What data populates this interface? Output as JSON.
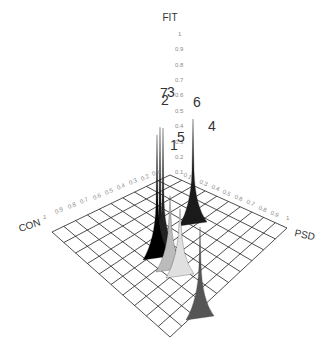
{
  "chart_data": {
    "type": "3d-surface",
    "title": "",
    "axes": {
      "z": {
        "label": "FIT",
        "ticks": [
          "0.1",
          "0.2",
          "0.3",
          "0.4",
          "0.5",
          "0.6",
          "0.7",
          "0.8",
          "0.9",
          "1"
        ],
        "range": [
          0,
          1
        ]
      },
      "x": {
        "label": "CON",
        "ticks": [
          "0.1",
          "0.2",
          "0.3",
          "0.4",
          "0.5",
          "0.6",
          "0.7",
          "0.8",
          "0.9",
          "1"
        ],
        "range": [
          0,
          1
        ]
      },
      "y": {
        "label": "PSD",
        "ticks": [
          "0.1",
          "0.2",
          "0.3",
          "0.4",
          "0.5",
          "0.6",
          "0.7",
          "0.8",
          "0.9",
          "1"
        ],
        "range": [
          0,
          1
        ]
      }
    },
    "grid": {
      "divisions": 10,
      "visible": true
    },
    "peaks": [
      {
        "label": "7",
        "con": 0.15,
        "psd": 0.35,
        "fit": 0.72,
        "shade": "#111111"
      },
      {
        "label": "3",
        "con": 0.15,
        "psd": 0.4,
        "fit": 0.7,
        "shade": "#222222"
      },
      {
        "label": "2",
        "con": 0.2,
        "psd": 0.35,
        "fit": 0.68,
        "shade": "#000000"
      },
      {
        "label": "6",
        "con": 0.0,
        "psd": 0.35,
        "fit": 0.55,
        "shade": "#1a1a1a"
      },
      {
        "label": "4",
        "con": 0.0,
        "psd": 0.65,
        "fit": 0.45,
        "shade": "#555555"
      },
      {
        "label": "5",
        "con": 0.15,
        "psd": 0.45,
        "fit": 0.33,
        "shade": "#bbbbbb"
      },
      {
        "label": "1",
        "con": 0.2,
        "psd": 0.45,
        "fit": 0.28,
        "shade": "#e0e0e0"
      }
    ]
  },
  "labels": {
    "fit": "FIT",
    "con": "CON",
    "psd": "PSD",
    "con_end": "1",
    "psd_end": "1",
    "fit_top": "1"
  },
  "fit_ticks": [
    "1",
    "0.9",
    "0.8",
    "0.7",
    "0.6",
    "0.5",
    "0.4",
    "0.3",
    "0.2",
    "0.1"
  ],
  "con_ticks": [
    "0.9",
    "0.8",
    "0.7",
    "0.6",
    "0.5",
    "0.4",
    "0.3",
    "0.2",
    "0.1"
  ],
  "psd_ticks": [
    "0.1",
    "0.3",
    "0.4",
    "0.5",
    "0.6",
    "0.7",
    "0.8",
    "0.9"
  ],
  "peak_labels": [
    "7",
    "3",
    "2",
    "6",
    "4",
    "5",
    "1"
  ]
}
